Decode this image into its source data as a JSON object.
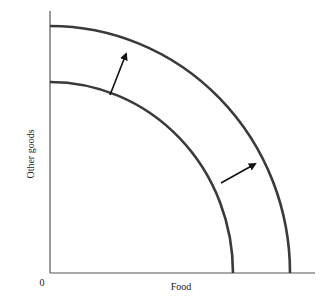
{
  "diagram": {
    "type": "production-possibilities-frontier-shift",
    "x_axis_label": "Food",
    "y_axis_label": "Other goods",
    "origin_label": "0",
    "curves": [
      {
        "name": "original-ppf",
        "description": "inner curve"
      },
      {
        "name": "shifted-ppf",
        "description": "outer curve"
      }
    ],
    "arrows": [
      {
        "name": "shift-arrow-upper",
        "direction": "outward"
      },
      {
        "name": "shift-arrow-lower",
        "direction": "outward"
      }
    ],
    "colors": {
      "curve": "#3a3a3a",
      "axis": "#555555",
      "arrow": "#111111",
      "background": "#ffffff"
    }
  }
}
